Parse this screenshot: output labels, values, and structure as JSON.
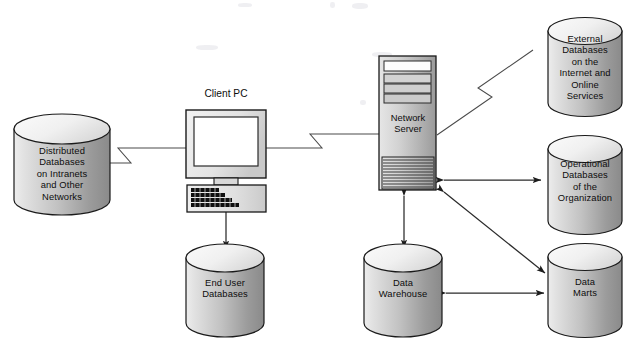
{
  "diagram": {
    "background_color": "#ffffff",
    "line_color": "#3d3d3d"
  },
  "nodes": {
    "distributed_db": {
      "label": "Distributed\nDatabases\non Intranets\nand Other\nNetworks",
      "shape": "cylinder",
      "x": 14,
      "y": 114,
      "w": 96,
      "h": 101
    },
    "client_pc": {
      "title": "Client PC",
      "shape": "computer",
      "x": 186,
      "y": 110,
      "w": 80,
      "h": 96
    },
    "network_server": {
      "label": "Network\nServer",
      "shape": "server-tower",
      "x": 379,
      "y": 56,
      "w": 57,
      "h": 134
    },
    "external_db": {
      "label": "External\nDatabases\non the\nInternet and\nOnline\nServices",
      "shape": "cylinder",
      "x": 548,
      "y": 16,
      "w": 74,
      "h": 102
    },
    "operational_db": {
      "label": "Operational\nDatabases\nof the\nOrganization",
      "shape": "cylinder",
      "x": 548,
      "y": 134,
      "w": 74,
      "h": 102
    },
    "data_marts": {
      "label": "Data\nMarts",
      "shape": "cylinder",
      "x": 548,
      "y": 243,
      "w": 74,
      "h": 95
    },
    "end_user_db": {
      "label": "End User\nDatabases",
      "shape": "cylinder",
      "x": 186,
      "y": 243,
      "w": 78,
      "h": 95
    },
    "data_warehouse": {
      "label": "Data\nWarehouse",
      "shape": "cylinder",
      "x": 364,
      "y": 243,
      "w": 78,
      "h": 95
    }
  },
  "connectors": [
    {
      "id": "distributed-to-pc",
      "from": "distributed_db",
      "to": "client_pc",
      "style": "lightning",
      "arrows": "none"
    },
    {
      "id": "pc-to-server",
      "from": "client_pc",
      "to": "network_server",
      "style": "lightning",
      "arrows": "none"
    },
    {
      "id": "server-to-external",
      "from": "network_server",
      "to": "external_db",
      "style": "lightning",
      "arrows": "none"
    },
    {
      "id": "server-to-operational",
      "from": "network_server",
      "to": "operational_db",
      "style": "line",
      "arrows": "both"
    },
    {
      "id": "server-to-datamarts",
      "from": "network_server",
      "to": "data_marts",
      "style": "line",
      "arrows": "both"
    },
    {
      "id": "server-to-warehouse",
      "from": "network_server",
      "to": "data_warehouse",
      "style": "line",
      "arrows": "both"
    },
    {
      "id": "warehouse-to-datamarts",
      "from": "data_warehouse",
      "to": "data_marts",
      "style": "line",
      "arrows": "both"
    },
    {
      "id": "pc-to-enduser",
      "from": "client_pc",
      "to": "end_user_db",
      "style": "line",
      "arrows": "both"
    }
  ]
}
